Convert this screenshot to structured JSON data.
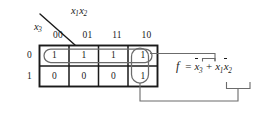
{
  "figure": {
    "kind": "karnaugh-map"
  },
  "axes": {
    "column_variable_label": "x1x2",
    "column_variable_base": "x",
    "column_variable_sub_1": "1",
    "column_variable_base_2": "x",
    "column_variable_sub_2": "2",
    "row_variable_base": "x",
    "row_variable_sub": "3"
  },
  "kmap": {
    "column_headers": [
      "00",
      "01",
      "11",
      "10"
    ],
    "row_headers": [
      "0",
      "1"
    ],
    "cells": [
      [
        "1",
        "1",
        "1",
        "1"
      ],
      [
        "0",
        "0",
        "0",
        "1"
      ]
    ]
  },
  "groups": [
    {
      "name": "group-row-top",
      "label": "x3-bar",
      "shape": "horizontal-oval",
      "covers": "entire top row (x3 = 0)"
    },
    {
      "name": "group-col-10",
      "label": "x1-x2-bar",
      "shape": "vertical-oval",
      "covers": "column 10 (x1=1, x2=0)"
    }
  ],
  "equation": {
    "function_symbol": "f",
    "equals": "=",
    "plus": "+",
    "term1_base": "x",
    "term1_sub": "3",
    "term2a_base": "x",
    "term2a_sub": "1",
    "term2b_base": "x",
    "term2b_sub": "2",
    "full_text": "f = x3' + x1 x2'"
  },
  "colors": {
    "ink": "#1a1a1a",
    "grid": "#1a1a1a",
    "oval": "#6b6b6b",
    "leader": "#6b6b6b",
    "background": "#ffffff"
  }
}
